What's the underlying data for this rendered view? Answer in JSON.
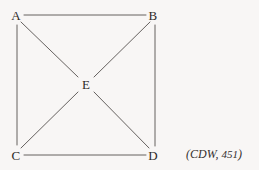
{
  "figure": {
    "type": "graph-diagram",
    "background_color": "#f8f6f5",
    "edge_color": "#55504e",
    "label_color": "#2e2a28",
    "nodes": [
      {
        "id": "A",
        "label": "A",
        "x": 16,
        "y": 15
      },
      {
        "id": "B",
        "label": "B",
        "x": 153,
        "y": 15
      },
      {
        "id": "C",
        "label": "C",
        "x": 16,
        "y": 155
      },
      {
        "id": "D",
        "label": "D",
        "x": 153,
        "y": 155
      },
      {
        "id": "E",
        "label": "E",
        "x": 86,
        "y": 84
      }
    ],
    "edges": [
      {
        "from": "A",
        "to": "B",
        "x1": 24,
        "y1": 15,
        "x2": 146,
        "y2": 15
      },
      {
        "from": "A",
        "to": "C",
        "x1": 17,
        "y1": 25,
        "x2": 17,
        "y2": 145
      },
      {
        "from": "B",
        "to": "D",
        "x1": 155,
        "y1": 25,
        "x2": 155,
        "y2": 146
      },
      {
        "from": "C",
        "to": "D",
        "x1": 24,
        "y1": 155,
        "x2": 146,
        "y2": 155
      },
      {
        "from": "A",
        "to": "E",
        "x1": 21,
        "y1": 22,
        "x2": 78,
        "y2": 77
      },
      {
        "from": "B",
        "to": "E",
        "x1": 150,
        "y1": 22,
        "x2": 94,
        "y2": 77
      },
      {
        "from": "C",
        "to": "E",
        "x1": 21,
        "y1": 148,
        "x2": 78,
        "y2": 92
      },
      {
        "from": "D",
        "to": "E",
        "x1": 149,
        "y1": 148,
        "x2": 94,
        "y2": 92
      }
    ],
    "citation": {
      "prefix": "(CDW, ",
      "number": "451",
      "suffix": ")",
      "x": 186,
      "y": 154
    }
  }
}
